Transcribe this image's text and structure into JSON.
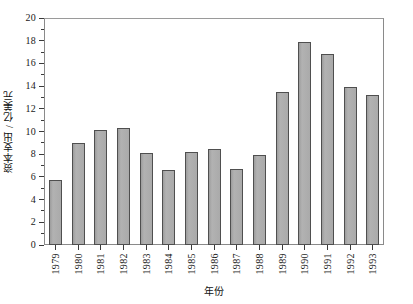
{
  "chart_data": {
    "type": "bar",
    "title": "",
    "xlabel": "年份",
    "ylabel": "资本支出 / 亿美元",
    "categories": [
      "1979",
      "1980",
      "1981",
      "1982",
      "1983",
      "1984",
      "1985",
      "1986",
      "1987",
      "1988",
      "1989",
      "1990",
      "1991",
      "1992",
      "1993"
    ],
    "values": [
      5.7,
      9.0,
      10.1,
      10.3,
      8.1,
      6.6,
      8.2,
      8.5,
      6.7,
      7.9,
      13.5,
      17.9,
      16.8,
      13.9,
      13.2
    ],
    "ylim": [
      0,
      20
    ],
    "yticks": [
      0,
      2,
      4,
      6,
      8,
      10,
      12,
      14,
      16,
      18,
      20
    ],
    "ytick_labels": [
      "0",
      "2",
      "4",
      "6",
      "8",
      "10",
      "12",
      "14",
      "16",
      "18",
      "20"
    ],
    "yminor_ticks": [
      1,
      3,
      5,
      7,
      9,
      11,
      13,
      15,
      17,
      19
    ],
    "grid": false,
    "legend": false,
    "bar_color": "#a9a9a9",
    "bar_edge_color": "#4f4f4f",
    "frame_color": "#8a8a8a",
    "background": "#ffffff"
  }
}
